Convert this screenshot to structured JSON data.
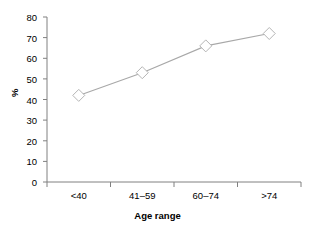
{
  "chart_data": {
    "type": "line",
    "title": "",
    "subtitle": "",
    "xlabel": "Age range",
    "ylabel": "%",
    "categories": [
      "<40",
      "41–59",
      "60–74",
      ">74"
    ],
    "values": [
      42,
      53,
      66,
      72
    ],
    "series": [
      {
        "name": "",
        "values": [
          42,
          53,
          66,
          72
        ]
      }
    ],
    "ylim": [
      0,
      80
    ],
    "yticks": [
      0,
      10,
      20,
      30,
      40,
      50,
      60,
      70,
      80
    ],
    "ytick_labels": [
      "0",
      "10",
      "20",
      "30",
      "40",
      "50",
      "60",
      "70",
      "80"
    ],
    "xtick_labels": [
      "<40",
      "41–59",
      "60–74",
      ">74"
    ],
    "grid": false,
    "legend": "none",
    "marker": "diamond",
    "marker_fill": "#ffffff",
    "line_color": "#a8a8a8",
    "axis_color": "#808080",
    "text_color": "#000000",
    "background": "#ffffff"
  },
  "axes": {
    "y_title": "%",
    "x_title": "Age range"
  }
}
